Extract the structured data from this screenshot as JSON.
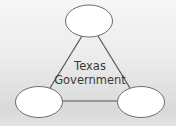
{
  "diagram": {
    "center_label": {
      "line1": "Texas",
      "line2": "Government"
    },
    "nodes": [
      {
        "id": "top",
        "label": ""
      },
      {
        "id": "bottom-left",
        "label": ""
      },
      {
        "id": "bottom-right",
        "label": ""
      }
    ],
    "edges": [
      {
        "from": "top",
        "to": "bottom-left"
      },
      {
        "from": "top",
        "to": "bottom-right"
      },
      {
        "from": "bottom-left",
        "to": "bottom-right"
      }
    ],
    "colors": {
      "node_fill": "#ffffff",
      "node_stroke": "#6e6e6e",
      "edge_stroke": "#555555",
      "text": "#3a3a3a"
    }
  }
}
